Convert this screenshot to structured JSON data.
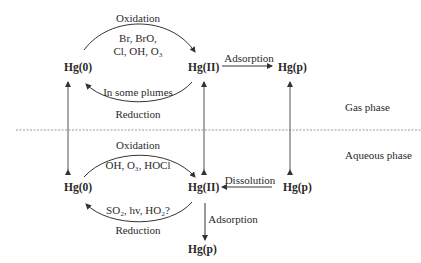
{
  "diagram": {
    "gas_phase": {
      "label": "Gas phase",
      "species": {
        "hg0": "Hg(0)",
        "hg2": "Hg(II)",
        "hgp": "Hg(p)"
      },
      "oxidation": {
        "label": "Oxidation",
        "agents_line1": "Br, BrO,",
        "agents_line2": "Cl, OH, O₃"
      },
      "reduction": {
        "label": "Reduction",
        "note": "In some plumes"
      },
      "adsorption": "Adsorption"
    },
    "aqueous_phase": {
      "label": "Aqueous phase",
      "species": {
        "hg0": "Hg(0)",
        "hg2": "Hg(II)",
        "hgp": "Hg(p)",
        "hgp_bottom": "Hg(p)"
      },
      "oxidation": {
        "label": "Oxidation",
        "agents": "OH, O₃, HOCl"
      },
      "reduction": {
        "label": "Reduction",
        "agents": "SO₂, hv, HO₂?"
      },
      "dissolution": "Dissolution",
      "adsorption": "Adsorption"
    },
    "colors": {
      "line": "#333333",
      "divider": "#999999",
      "text": "#2a2a2a"
    }
  }
}
